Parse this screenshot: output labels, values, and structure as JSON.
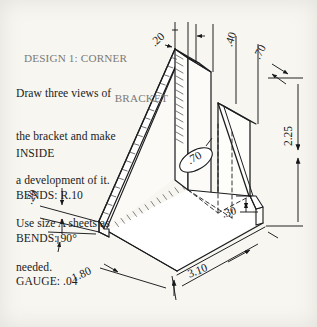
{
  "sheet": {
    "background_color": "#f7f6f1",
    "line_color": "#1b1c1e",
    "title_color": "#7b7a76"
  },
  "title": {
    "line1": "DESIGN 1: CORNER",
    "line2": "BRACKET"
  },
  "instructions": {
    "line1": "Draw three views of",
    "line2": "the bracket and make",
    "line3": "a development of it.",
    "line4": "Use size A sheets as",
    "line5": "needed."
  },
  "specs": {
    "line1": "INSIDE",
    "line2": "BENDS: R.10",
    "line3": "BENDS: 90°",
    "line4": "GAUGE: .04"
  },
  "dimensions": [
    {
      "id": "top-flange-width",
      "label": ".20",
      "x": 152,
      "y": 38,
      "rotate": -42
    },
    {
      "id": "back-flange-depth",
      "label": ".40",
      "x": 228,
      "y": 40,
      "rotate": -72
    },
    {
      "id": "side-flange-depth",
      "label": ".70",
      "x": 256,
      "y": 52,
      "rotate": -62
    },
    {
      "id": "overall-height",
      "label": "2.25",
      "x": 288,
      "y": 140,
      "rotate": -90
    },
    {
      "id": "slot-length",
      "label": ".70",
      "x": 188,
      "y": 155,
      "rotate": -30
    },
    {
      "id": "bottom-flange-rise",
      "label": ".30",
      "x": 222,
      "y": 208,
      "rotate": -18
    },
    {
      "id": "left-flange-height",
      "label": ".20",
      "x": 28,
      "y": 197,
      "rotate": -62
    },
    {
      "id": "base-width",
      "label": "1.80",
      "x": 72,
      "y": 272,
      "rotate": -24
    },
    {
      "id": "base-depth",
      "label": "3.10",
      "x": 188,
      "y": 268,
      "rotate": -21
    }
  ]
}
